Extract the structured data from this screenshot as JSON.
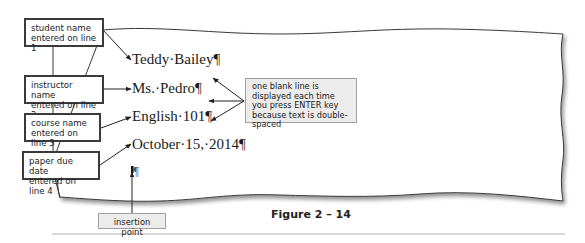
{
  "document": {
    "lines": [
      {
        "text": "Teddy·Bailey¶"
      },
      {
        "text": "Ms.·Pedro¶"
      },
      {
        "text": "English·101¶"
      },
      {
        "text": "October·15,·2014¶"
      },
      {
        "text": "¶"
      }
    ]
  },
  "annotations": {
    "labels": [
      {
        "text": "student name\nentered on line 1"
      },
      {
        "text": "instructor name\nentered on line 2"
      },
      {
        "text": "course name\nentered on line 3"
      },
      {
        "text": "paper due date\nentered on line 4"
      }
    ],
    "callout": {
      "text": "one blank line is displayed each time you press ENTER key because text is double-spaced"
    },
    "insertion_point": {
      "text": "insertion point"
    }
  },
  "figure": {
    "caption": "Figure 2 – 14"
  },
  "colors": {
    "page_border": "#3a3a3a",
    "label_border": "#3a3a3a",
    "callout_bg": "#ececec",
    "callout_border": "#a0a0a0",
    "rule": "#b0b0b0"
  }
}
